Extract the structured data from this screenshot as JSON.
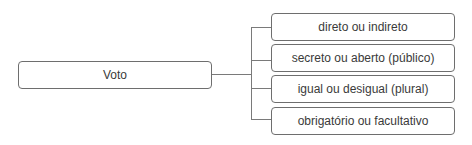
{
  "diagram": {
    "type": "tree",
    "root": {
      "label": "Voto"
    },
    "children": [
      {
        "label": "direto ou indireto"
      },
      {
        "label": "secreto ou aberto (público)"
      },
      {
        "label": "igual ou desigual (plural)"
      },
      {
        "label": "obrigatório ou facultativo"
      }
    ],
    "colors": {
      "border": "#6e6e6e",
      "line": "#7a7a7a",
      "text": "#3a3a3a",
      "background": "#ffffff"
    }
  }
}
